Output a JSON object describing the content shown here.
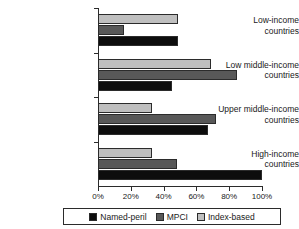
{
  "chart_data": {
    "type": "bar",
    "orientation": "horizontal",
    "title": "",
    "xlabel": "",
    "ylabel": "",
    "xlim": [
      0,
      100
    ],
    "grid": false,
    "legend_position": "bottom",
    "categories": [
      "Low-income countries",
      "Low middle-income countries",
      "Upper middle-income countries",
      "High-income countries"
    ],
    "category_lines": [
      [
        "Low-income",
        "countries"
      ],
      [
        "Low middle-income",
        "countries"
      ],
      [
        "Upper middle-income",
        "countries"
      ],
      [
        "High-income",
        "countries"
      ]
    ],
    "xticks": [
      0,
      20,
      40,
      60,
      80,
      100
    ],
    "xtick_labels": [
      "0%",
      "20%",
      "40%",
      "60%",
      "80%",
      "100%"
    ],
    "series": [
      {
        "name": "Named-peril",
        "color": "#0d0d0d",
        "values": [
          49,
          45,
          67,
          100
        ]
      },
      {
        "name": "MPCI",
        "color": "#585858",
        "values": [
          16,
          85,
          72,
          48
        ]
      },
      {
        "name": "Index-based",
        "color": "#bfbfbf",
        "values": [
          49,
          69,
          33,
          33
        ]
      }
    ],
    "series_draw_order": [
      "Index-based",
      "MPCI",
      "Named-peril"
    ]
  },
  "legend": {
    "entries": [
      {
        "label": "Named-peril",
        "color": "#0d0d0d"
      },
      {
        "label": "MPCI",
        "color": "#585858"
      },
      {
        "label": "Index-based",
        "color": "#bfbfbf"
      }
    ]
  }
}
